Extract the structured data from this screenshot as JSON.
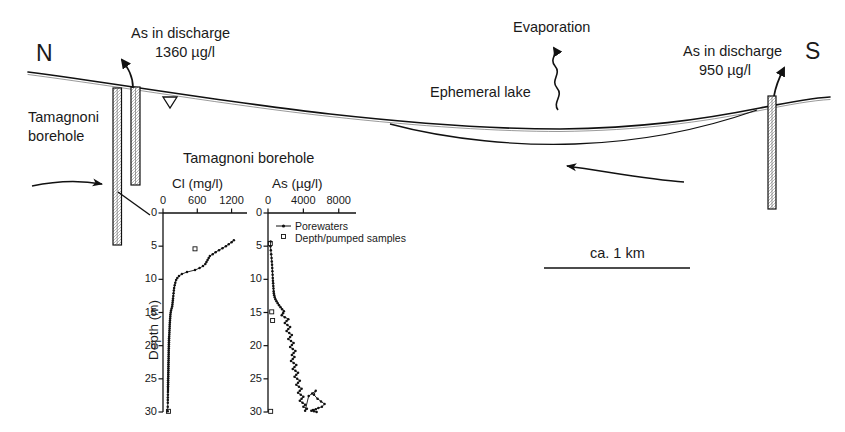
{
  "figure": {
    "type": "hydrogeological-cross-section",
    "compass": {
      "north": "N",
      "south": "S"
    },
    "annotations": {
      "discharge_north_line1": "As in discharge",
      "discharge_north_line2": "1360 µg/l",
      "discharge_south_line1": "As in discharge",
      "discharge_south_line2": "950 µg/l",
      "evaporation": "Evaporation",
      "ephemeral_lake": "Ephemeral lake",
      "borehole_left_line1": "Tamagnoni",
      "borehole_left_line2": "borehole",
      "scale_bar": "ca. 1 km"
    }
  },
  "chart_data": [
    {
      "type": "line",
      "id": "cl-profile",
      "title": "Tamagnoni borehole",
      "xlabel": "Cl (mg/l)",
      "ylabel": "Depth (m)",
      "xlim": [
        0,
        1400
      ],
      "ylim": [
        0,
        30
      ],
      "grid": false,
      "xticks": [
        0,
        600,
        1200
      ],
      "xticklabels": [
        "0",
        "600",
        "1200"
      ],
      "yticks": [
        0,
        5,
        10,
        15,
        20,
        25,
        30
      ],
      "yticklabels": [
        "0",
        "5",
        "10",
        "15",
        "20",
        "25",
        "30"
      ],
      "y_inverted": true,
      "legend": null,
      "series": [
        {
          "name": "Porewaters",
          "marker": "filled-circle",
          "x": [
            1240,
            1200,
            1150,
            1100,
            1040,
            980,
            920,
            870,
            820,
            800,
            780,
            760,
            740,
            700,
            640,
            560,
            420,
            330,
            280,
            250,
            230,
            215,
            205,
            195,
            190,
            185,
            180,
            175,
            172,
            168,
            165,
            160,
            150,
            140,
            135,
            130,
            128,
            125,
            122,
            120,
            118,
            116,
            115,
            113,
            112,
            110,
            108,
            106,
            105,
            104,
            103,
            102,
            101,
            100,
            100,
            99,
            98,
            98,
            97,
            96,
            95,
            95,
            94,
            94,
            93,
            92,
            92,
            91,
            90,
            90,
            89,
            88,
            88,
            87,
            86,
            86,
            85,
            84,
            84,
            83,
            82
          ],
          "depth": [
            4.1,
            4.4,
            4.7,
            5.0,
            5.3,
            5.6,
            5.9,
            6.2,
            6.5,
            6.8,
            7.1,
            7.4,
            7.7,
            8.0,
            8.3,
            8.6,
            8.9,
            9.2,
            9.5,
            9.8,
            10.1,
            10.5,
            10.9,
            11.3,
            11.7,
            12.1,
            12.5,
            12.9,
            13.2,
            13.5,
            13.8,
            14.1,
            14.4,
            14.7,
            15.0,
            15.3,
            15.6,
            15.9,
            16.2,
            16.5,
            16.8,
            17.1,
            17.4,
            17.7,
            18.0,
            18.3,
            18.6,
            18.9,
            19.2,
            19.5,
            19.8,
            20.1,
            20.4,
            20.7,
            21.0,
            21.3,
            21.6,
            21.9,
            22.2,
            22.5,
            22.8,
            23.1,
            23.4,
            23.7,
            24.0,
            24.3,
            24.6,
            24.9,
            25.2,
            25.5,
            25.8,
            26.1,
            26.4,
            26.7,
            27.0,
            27.4,
            27.8,
            28.2,
            28.6,
            29.2,
            29.9
          ]
        },
        {
          "name": "Depth/pumped samples",
          "marker": "open-square",
          "x": [
            560,
            95
          ],
          "depth": [
            5.4,
            29.9
          ]
        }
      ]
    },
    {
      "type": "line",
      "id": "as-profile",
      "title": "Tamagnoni borehole",
      "xlabel": "As (µg/l)",
      "ylabel": "Depth (m)",
      "xlim": [
        0,
        9500
      ],
      "ylim": [
        0,
        30
      ],
      "grid": false,
      "xticks": [
        0,
        4000,
        8000
      ],
      "xticklabels": [
        "0",
        "4000",
        "8000"
      ],
      "yticks": [
        0,
        5,
        10,
        15,
        20,
        25,
        30
      ],
      "yticklabels": [
        "0",
        "5",
        "10",
        "15",
        "20",
        "25",
        "30"
      ],
      "y_inverted": true,
      "legend": {
        "position": "top-right-inside",
        "entries": [
          {
            "label": "Porewaters",
            "marker": "line-filled-circle"
          },
          {
            "label": "Depth/pumped samples",
            "marker": "open-square"
          }
        ]
      },
      "series": [
        {
          "name": "Porewaters",
          "marker": "filled-circle",
          "x": [
            300,
            280,
            320,
            360,
            400,
            430,
            460,
            480,
            500,
            520,
            540,
            560,
            580,
            600,
            620,
            640,
            660,
            700,
            760,
            840,
            960,
            1100,
            1250,
            1420,
            1600,
            1800,
            1700,
            1550,
            1900,
            2300,
            2100,
            1900,
            2200,
            2500,
            2300,
            2100,
            2400,
            2700,
            2500,
            2300,
            2600,
            2900,
            2700,
            2500,
            2800,
            3100,
            2900,
            2700,
            3000,
            2800,
            2600,
            2900,
            3200,
            3000,
            2800,
            3100,
            3400,
            3200,
            3000,
            3300,
            3600,
            3400,
            3200,
            3500,
            3800,
            3600,
            3400,
            3700,
            4000,
            3800,
            3600,
            3900,
            4200,
            4000,
            4400,
            4200,
            4600,
            5000,
            5400,
            5200,
            5600,
            6000,
            6400,
            6100,
            5700,
            5400,
            5100,
            4900,
            5200,
            5500
          ],
          "depth": [
            4.3,
            5.0,
            5.6,
            6.2,
            6.8,
            7.3,
            7.8,
            8.3,
            8.8,
            9.3,
            9.8,
            10.2,
            10.6,
            11.0,
            11.4,
            11.8,
            12.1,
            12.4,
            12.7,
            13.0,
            13.3,
            13.6,
            13.9,
            14.2,
            14.5,
            14.8,
            15.1,
            15.4,
            15.7,
            16.0,
            16.3,
            16.6,
            16.9,
            17.2,
            17.5,
            17.8,
            18.1,
            18.4,
            18.7,
            19.0,
            19.3,
            19.6,
            19.9,
            20.2,
            20.5,
            20.8,
            21.1,
            21.4,
            21.7,
            22.0,
            22.3,
            22.6,
            22.9,
            23.2,
            23.5,
            23.8,
            24.1,
            24.4,
            24.7,
            25.0,
            25.3,
            25.6,
            25.9,
            26.2,
            26.5,
            26.8,
            27.1,
            27.4,
            27.7,
            28.0,
            28.3,
            28.6,
            28.9,
            29.2,
            29.5,
            29.8,
            27.6,
            27.2,
            26.8,
            27.4,
            28.0,
            28.4,
            28.8,
            29.2,
            29.4,
            29.6,
            29.7,
            29.8,
            29.9,
            30.0
          ]
        },
        {
          "name": "Depth/pumped samples",
          "marker": "open-square",
          "x": [
            260,
            420,
            520,
            300
          ],
          "depth": [
            4.6,
            14.9,
            16.2,
            29.9
          ]
        }
      ]
    }
  ]
}
